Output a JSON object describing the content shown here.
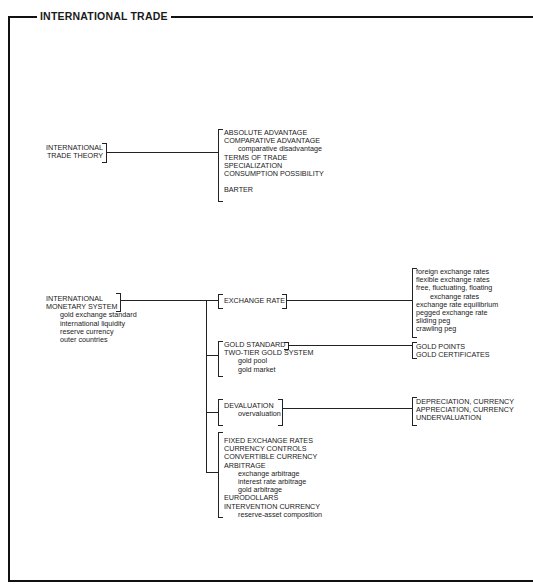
{
  "page": {
    "number": "150"
  },
  "title": "INTERNATIONAL TRADE",
  "sections": {
    "trade_theory": {
      "root": [
        "INTERNATIONAL",
        "TRADE THEORY"
      ],
      "children": [
        {
          "text": "ABSOLUTE ADVANTAGE",
          "indent": 0
        },
        {
          "text": "COMPARATIVE ADVANTAGE",
          "indent": 0
        },
        {
          "text": "comparative disadvantage",
          "indent": 1
        },
        {
          "text": "TERMS OF TRADE",
          "indent": 0
        },
        {
          "text": "SPECIALIZATION",
          "indent": 0
        },
        {
          "text": "CONSUMPTION POSSIBILITY",
          "indent": 0
        },
        {
          "text": "BARTER",
          "indent": 0
        }
      ]
    },
    "monetary_system": {
      "root": [
        "INTERNATIONAL",
        "MONETARY SYSTEM"
      ],
      "root_sub": [
        "gold exchange standard",
        "international liquidity",
        "reserve currency",
        "outer countries"
      ],
      "branches": [
        {
          "label": [
            "EXCHANGE RATE"
          ],
          "targets": [
            "foreign exchange rates",
            "flexible exchange rates",
            "free, fluctuating, floating",
            "exchange rates",
            "exchange rate equilibrium",
            "pegged exchange rate",
            "sliding peg",
            "crawling peg"
          ]
        },
        {
          "label": [
            "GOLD STANDARD",
            "TWO-TIER GOLD SYSTEM",
            "gold pool",
            "gold market"
          ],
          "targets": [
            "GOLD POINTS",
            "GOLD CERTIFICATES"
          ]
        },
        {
          "label": [
            "DEVALUATION",
            "overvaluation"
          ],
          "targets": [
            "DEPRECIATION, CURRENCY",
            "APPRECIATION, CURRENCY",
            "UNDERVALUATION"
          ]
        },
        {
          "label": [
            "FIXED EXCHANGE RATES",
            "CURRENCY CONTROLS",
            "CONVERTIBLE CURRENCY",
            "ARBITRAGE",
            "exchange arbitrage",
            "interest rate arbitrage",
            "gold arbitrage",
            "EURODOLLARS",
            "INTERVENTION CURRENCY",
            "reserve-asset composition"
          ],
          "targets": []
        }
      ]
    }
  }
}
